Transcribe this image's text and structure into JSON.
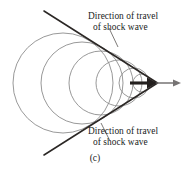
{
  "figure": {
    "caption": "(c)",
    "labels": {
      "top": {
        "line1": "Direction of travel",
        "line2": "of shock wave"
      },
      "bottom": {
        "line1": "Direction of travel",
        "line2": "of shock wave"
      }
    },
    "colors": {
      "wavefront": "#8d8d8d",
      "shock_line": "#2b2725",
      "velocity_arrow": "#231f1e",
      "continuation_arrow": "#767373",
      "leader_line": "#45403e",
      "text": "#201d1c",
      "background": "#ffffff"
    }
  },
  "chart_data": {
    "type": "scatter",
    "title": "",
    "subtitle": "",
    "xlabel": "",
    "ylabel": "",
    "xlim": [
      0,
      190
    ],
    "ylim": [
      0,
      171
    ],
    "grid": false,
    "legend_position": "none",
    "axis_line_y": 83,
    "wavefronts": [
      {
        "name": "wavefront-1-oldest",
        "cx": 63,
        "cy": 83,
        "r": 50
      },
      {
        "name": "wavefront-2",
        "cx": 82,
        "cy": 83,
        "r": 41
      },
      {
        "name": "wavefront-3",
        "cx": 101,
        "cy": 83,
        "r": 32
      },
      {
        "name": "wavefront-4",
        "cx": 119,
        "cy": 83,
        "r": 23
      },
      {
        "name": "wavefront-5",
        "cx": 134,
        "cy": 83,
        "r": 15
      },
      {
        "name": "wavefront-6-newest",
        "cx": 142,
        "cy": 83,
        "r": 9
      }
    ],
    "mach_cone": {
      "apex": [
        157,
        83
      ],
      "upper_line_start": [
        44,
        11
      ],
      "lower_line_start": [
        44,
        155
      ],
      "half_angle_deg": 26
    },
    "velocity_arrow": {
      "name": "direction-of-motion",
      "from": [
        130,
        83
      ],
      "to": [
        157,
        83
      ],
      "style": "thick-black"
    },
    "continuation_arrow": {
      "name": "travel-continuation",
      "from": [
        157,
        83
      ],
      "to": [
        181,
        83
      ],
      "style": "thin-gray"
    },
    "leader_lines": [
      {
        "name": "leader-top",
        "from": [
          109,
          28
        ],
        "to": [
          118,
          47
        ]
      },
      {
        "name": "leader-bottom",
        "from": [
          110,
          141
        ],
        "to": [
          101,
          123
        ]
      }
    ]
  }
}
